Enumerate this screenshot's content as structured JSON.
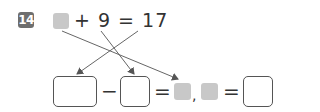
{
  "problem": {
    "number": "14",
    "equation_text": "+ 9 = 17",
    "bottom_row": {
      "minus": "−",
      "equals1": "=",
      "comma": ",",
      "equals2": "="
    }
  },
  "colors": {
    "badge": "#6e6e6e",
    "placeholder_square": "#c8c8c8",
    "line": "#555555"
  }
}
